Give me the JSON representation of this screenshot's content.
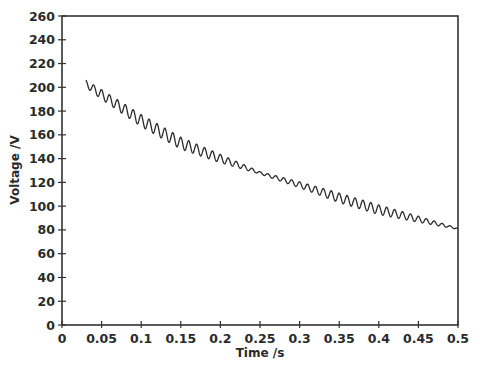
{
  "chart_data": {
    "type": "line",
    "title": "",
    "xlabel": "Time /s",
    "ylabel": "Voltage /V",
    "xlim": [
      0,
      0.5
    ],
    "ylim": [
      0,
      260
    ],
    "grid": false,
    "legend": null,
    "x_ticks": [
      0,
      0.05,
      0.1,
      0.15,
      0.2,
      0.25,
      0.3,
      0.35,
      0.4,
      0.45,
      0.5
    ],
    "x_tick_labels": [
      "0",
      "0.05",
      "0.1",
      "0.15",
      "0.2",
      "0.25",
      "0.3",
      "0.35",
      "0.4",
      "0.45",
      "0.5"
    ],
    "y_ticks": [
      0,
      20,
      40,
      60,
      80,
      100,
      120,
      140,
      160,
      180,
      200,
      220,
      240,
      260
    ],
    "y_tick_labels": [
      "0",
      "20",
      "40",
      "60",
      "80",
      "100",
      "120",
      "140",
      "160",
      "180",
      "200",
      "220",
      "240",
      "260"
    ],
    "series": [
      {
        "name": "Voltage",
        "description": "Decaying voltage with superimposed ripple (~100 Hz)",
        "x": [
          0.03,
          0.05,
          0.1,
          0.15,
          0.2,
          0.25,
          0.3,
          0.35,
          0.4,
          0.45,
          0.5
        ],
        "values": [
          203,
          194,
          172,
          153,
          140,
          128,
          118,
          107,
          97,
          89,
          81
        ],
        "ripple_amplitude": [
          3,
          4,
          5,
          5,
          3.5,
          1,
          2.5,
          4,
          4,
          2.5,
          0.5
        ],
        "ripple_frequency_hz": 100
      }
    ]
  }
}
